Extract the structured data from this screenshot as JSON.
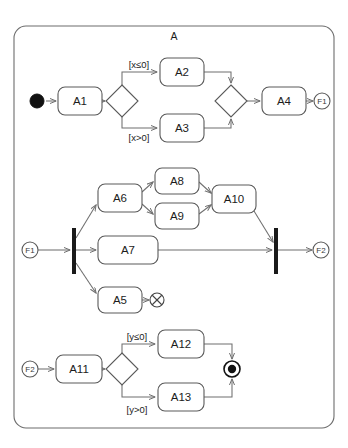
{
  "diagram": {
    "kind": "uml-activity-diagram",
    "frame": {
      "title": "A",
      "x": 14,
      "y": 26,
      "width": 320,
      "height": 402,
      "corner_radius": 12
    },
    "colors": {
      "background": "#ffffff",
      "stroke": "#5a5a5a",
      "edge": "#6f6f6f",
      "bar": "#1a1a1a",
      "text": "#1c1c1c",
      "frame_stroke": "#6d6d6d"
    },
    "rows": [
      {
        "id": "row-1",
        "description": "Initial node through decision, branches A2/A3, merge, A4, to connector F1"
      },
      {
        "id": "row-2",
        "description": "Connector F1 through fork into A6/A7/A5, rejoining at join bar to connector F2"
      },
      {
        "id": "row-3",
        "description": "Connector F2 through A11 decision into A12/A13 to activity final node"
      }
    ],
    "nodes": [
      {
        "id": "init",
        "type": "initial-node",
        "label": "",
        "cx": 37,
        "cy": 101,
        "r": 7
      },
      {
        "id": "A1",
        "type": "action",
        "label": "A1",
        "x": 58,
        "y": 87,
        "w": 44,
        "h": 28
      },
      {
        "id": "d1",
        "type": "decision",
        "label": "",
        "cx": 122,
        "cy": 101,
        "rx": 16,
        "ry": 16
      },
      {
        "id": "A2",
        "type": "action",
        "label": "A2",
        "x": 160,
        "y": 58,
        "w": 44,
        "h": 28
      },
      {
        "id": "A3",
        "type": "action",
        "label": "A3",
        "x": 160,
        "y": 114,
        "w": 44,
        "h": 28
      },
      {
        "id": "m1",
        "type": "merge",
        "label": "",
        "cx": 231,
        "cy": 101,
        "rx": 16,
        "ry": 16
      },
      {
        "id": "A4",
        "type": "action",
        "label": "A4",
        "x": 262,
        "y": 87,
        "w": 44,
        "h": 28
      },
      {
        "id": "F1out",
        "type": "connector",
        "label": "F1",
        "cx": 322,
        "cy": 101,
        "r": 8
      },
      {
        "id": "F1in",
        "type": "connector",
        "label": "F1",
        "cx": 30,
        "cy": 250,
        "r": 8
      },
      {
        "id": "fork",
        "type": "fork-bar",
        "label": "",
        "x": 72,
        "y": 228,
        "w": 4,
        "h": 46
      },
      {
        "id": "A6",
        "type": "action",
        "label": "A6",
        "x": 98,
        "y": 184,
        "w": 44,
        "h": 28
      },
      {
        "id": "A8",
        "type": "action",
        "label": "A8",
        "x": 155,
        "y": 168,
        "w": 44,
        "h": 26
      },
      {
        "id": "A9",
        "type": "action",
        "label": "A9",
        "x": 155,
        "y": 203,
        "w": 44,
        "h": 26
      },
      {
        "id": "A10",
        "type": "action",
        "label": "A10",
        "x": 212,
        "y": 185,
        "w": 44,
        "h": 28
      },
      {
        "id": "A7",
        "type": "action",
        "label": "A7",
        "x": 98,
        "y": 236,
        "w": 60,
        "h": 28
      },
      {
        "id": "A5",
        "type": "action",
        "label": "A5",
        "x": 98,
        "y": 287,
        "w": 44,
        "h": 26
      },
      {
        "id": "ff",
        "type": "flow-final",
        "label": "",
        "cx": 157,
        "cy": 300,
        "r": 7
      },
      {
        "id": "join",
        "type": "join-bar",
        "label": "",
        "x": 274,
        "y": 228,
        "w": 4,
        "h": 46
      },
      {
        "id": "F2out",
        "type": "connector",
        "label": "F2",
        "cx": 321,
        "cy": 250,
        "r": 8
      },
      {
        "id": "F2in",
        "type": "connector",
        "label": "F2",
        "cx": 30,
        "cy": 369,
        "r": 8
      },
      {
        "id": "A11",
        "type": "action",
        "label": "A11",
        "x": 56,
        "y": 355,
        "w": 46,
        "h": 28
      },
      {
        "id": "d2",
        "type": "decision",
        "label": "",
        "cx": 122,
        "cy": 369,
        "rx": 16,
        "ry": 16
      },
      {
        "id": "A12",
        "type": "action",
        "label": "A12",
        "x": 158,
        "y": 330,
        "w": 46,
        "h": 28
      },
      {
        "id": "A13",
        "type": "action",
        "label": "A13",
        "x": 158,
        "y": 383,
        "w": 46,
        "h": 28
      },
      {
        "id": "final",
        "type": "activity-final",
        "label": "",
        "cx": 232,
        "cy": 369,
        "r": 8
      }
    ],
    "guards": [
      {
        "id": "g1",
        "text": "[x≤0]",
        "x": 139,
        "y": 64
      },
      {
        "id": "g2",
        "text": "[x>0]",
        "x": 139,
        "y": 137
      },
      {
        "id": "g3",
        "text": "[y≤0]",
        "x": 137,
        "y": 336
      },
      {
        "id": "g4",
        "text": "[y>0]",
        "x": 137,
        "y": 409
      }
    ],
    "edges": [
      {
        "id": "e1",
        "from": "init",
        "to": "A1",
        "path": "M 46,101 L 56,101",
        "arrow": true
      },
      {
        "id": "e2",
        "from": "A1",
        "to": "d1",
        "path": "M 102,101 L 105,101",
        "arrow": true
      },
      {
        "id": "e3",
        "from": "d1",
        "to": "A2",
        "path": "M 122,87 L 122,72 L 157,72",
        "arrow": true
      },
      {
        "id": "e4",
        "from": "d1",
        "to": "A3",
        "path": "M 122,115 L 122,128 L 157,128",
        "arrow": true
      },
      {
        "id": "e5",
        "from": "A2",
        "to": "m1",
        "path": "M 204,72 L 231,72 L 231,83",
        "arrow": true
      },
      {
        "id": "e6",
        "from": "A3",
        "to": "m1",
        "path": "M 204,128 L 231,128 L 231,119",
        "arrow": true
      },
      {
        "id": "e7",
        "from": "m1",
        "to": "A4",
        "path": "M 247,101 L 260,101",
        "arrow": true
      },
      {
        "id": "e8",
        "from": "A4",
        "to": "F1out",
        "path": "M 306,101 L 313,101",
        "arrow": true
      },
      {
        "id": "e9",
        "from": "F1in",
        "to": "fork",
        "path": "M 38,250 L 70,250",
        "arrow": true
      },
      {
        "id": "e10",
        "from": "fork",
        "to": "A6",
        "path": "M 76,238 L 96,205",
        "arrow": true
      },
      {
        "id": "e11",
        "from": "fork",
        "to": "A7",
        "path": "M 76,250 L 96,250",
        "arrow": true
      },
      {
        "id": "e12",
        "from": "fork",
        "to": "A5",
        "path": "M 76,263 L 96,293",
        "arrow": true
      },
      {
        "id": "e13",
        "from": "A6",
        "to": "A8",
        "path": "M 142,192 L 153,182",
        "arrow": true
      },
      {
        "id": "e14",
        "from": "A6",
        "to": "A9",
        "path": "M 142,204 L 153,214",
        "arrow": true
      },
      {
        "id": "e15",
        "from": "A8",
        "to": "A10",
        "path": "M 199,182 L 211,193",
        "arrow": true
      },
      {
        "id": "e16",
        "from": "A9",
        "to": "A10",
        "path": "M 199,214 L 211,205",
        "arrow": true
      },
      {
        "id": "e17",
        "from": "A10",
        "to": "join",
        "path": "M 254,211 L 273,242",
        "arrow": true
      },
      {
        "id": "e18",
        "from": "A7",
        "to": "join",
        "path": "M 158,250 L 272,250",
        "arrow": true
      },
      {
        "id": "e19",
        "from": "A5",
        "to": "ff",
        "path": "M 142,300 L 149,300",
        "arrow": true
      },
      {
        "id": "e20",
        "from": "join",
        "to": "F2out",
        "path": "M 278,250 L 312,250",
        "arrow": true
      },
      {
        "id": "e21",
        "from": "F2in",
        "to": "A11",
        "path": "M 38,369 L 54,369",
        "arrow": true
      },
      {
        "id": "e22",
        "from": "A11",
        "to": "d2",
        "path": "M 102,369 L 105,369",
        "arrow": true
      },
      {
        "id": "e23",
        "from": "d2",
        "to": "A12",
        "path": "M 122,355 L 122,344 L 155,344",
        "arrow": true
      },
      {
        "id": "e24",
        "from": "d2",
        "to": "A13",
        "path": "M 122,383 L 122,397 L 155,397",
        "arrow": true
      },
      {
        "id": "e25",
        "from": "A12",
        "to": "final",
        "path": "M 204,344 L 232,344 L 232,359",
        "arrow": true
      },
      {
        "id": "e26",
        "from": "A13",
        "to": "final",
        "path": "M 204,397 L 232,397 L 232,379",
        "arrow": true
      }
    ]
  }
}
